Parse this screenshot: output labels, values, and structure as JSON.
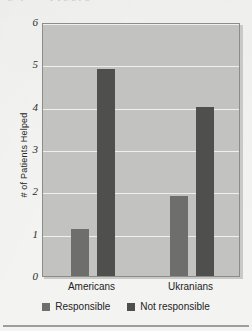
{
  "scan": {
    "top_cut_text": "ghijklmnopq g g j g"
  },
  "chart_data": {
    "type": "bar",
    "title": "",
    "xlabel": "",
    "ylabel": "# of Patients Helped",
    "categories": [
      "Americans",
      "Ukranians"
    ],
    "series": [
      {
        "name": "Responsible",
        "values": [
          1.1,
          1.9
        ],
        "color": "#6e6e6c"
      },
      {
        "name": "Not responsible",
        "values": [
          4.9,
          4.0
        ],
        "color": "#4f4f4d"
      }
    ],
    "ylim": [
      0,
      6
    ],
    "yticks": [
      0,
      1,
      2,
      3,
      4,
      5,
      6
    ],
    "ytick_labels": [
      "0",
      "1",
      "2",
      "3",
      "4",
      "5",
      "6"
    ],
    "grid": true,
    "legend_position": "bottom"
  },
  "axis": {
    "y_label": "# of Patients Helped",
    "y_tick_0": "0",
    "y_tick_1": "1",
    "y_tick_2": "2",
    "y_tick_3": "3",
    "y_tick_4": "4",
    "y_tick_5": "5",
    "y_tick_6": "6",
    "x_tick_0": "Americans",
    "x_tick_1": "Ukranians"
  },
  "legend": {
    "items": [
      {
        "label": "Responsible",
        "color": "#6e6e6c"
      },
      {
        "label": "Not responsible",
        "color": "#4f4f4d"
      }
    ]
  }
}
